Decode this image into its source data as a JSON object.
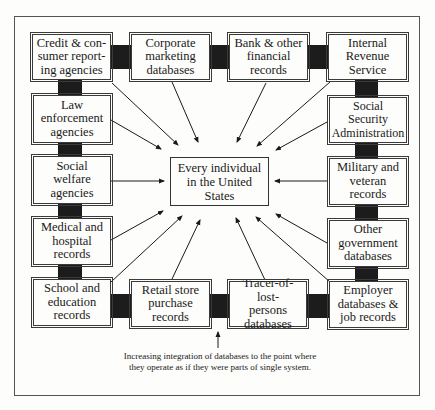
{
  "diagram": {
    "center": {
      "label": "Every individual\nin the United\nStates"
    },
    "sources": [
      {
        "id": "credit",
        "label": "Credit & con-\nsumer report-\ning agencies"
      },
      {
        "id": "corporate",
        "label": "Corporate\nmarketing\ndatabases"
      },
      {
        "id": "bank",
        "label": "Bank & other\nfinancial\nrecords"
      },
      {
        "id": "irs",
        "label": "Internal\nRevenue\nService"
      },
      {
        "id": "law",
        "label": "Law\nenforcement\nagencies"
      },
      {
        "id": "ssa",
        "label": "Social Security\nAdministration"
      },
      {
        "id": "welfare",
        "label": "Social\nwelfare\nagencies"
      },
      {
        "id": "military",
        "label": "Military and\nveteran\nrecords"
      },
      {
        "id": "medical",
        "label": "Medical and\nhospital\nrecords"
      },
      {
        "id": "othergov",
        "label": "Other\ngovernment\ndatabases"
      },
      {
        "id": "school",
        "label": "School and\neducation\nrecords"
      },
      {
        "id": "retail",
        "label": "Retail store\npurchase\nrecords"
      },
      {
        "id": "tracer",
        "label": "Tracer-of-lost-\npersons\ndatabases"
      },
      {
        "id": "employer",
        "label": "Employer\ndatabases &\njob records"
      }
    ],
    "caption": "Increasing integration of databases to the point where\nthey operate as if they were parts of single system.",
    "colors": {
      "line": "#1a1a1a",
      "connector": "#1c1c1c",
      "background": "#fdfdfb"
    }
  }
}
